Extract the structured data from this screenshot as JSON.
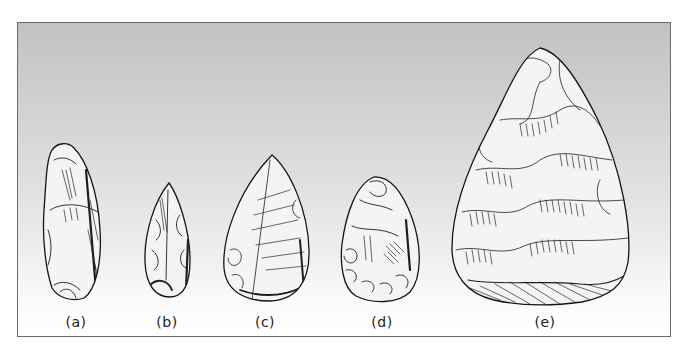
{
  "figure": {
    "background_gradient": [
      "#c2c2c2",
      "#ffffff"
    ],
    "border_color": "#6a6a6a",
    "items": [
      {
        "id": "a",
        "label": "(a)"
      },
      {
        "id": "b",
        "label": "(b)"
      },
      {
        "id": "c",
        "label": "(c)"
      },
      {
        "id": "d",
        "label": "(d)"
      },
      {
        "id": "e",
        "label": "(e)"
      }
    ]
  }
}
